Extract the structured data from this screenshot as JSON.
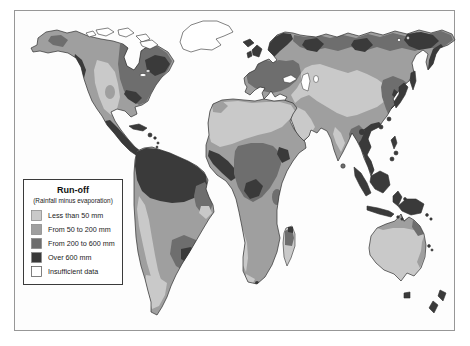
{
  "colors": {
    "less_than_50": "#c9c9c9",
    "from_50_to_200": "#9f9f9f",
    "from_200_to_600": "#6e6e6e",
    "over_600": "#3a3a3a",
    "insufficient_data": "#ffffff",
    "ocean": "#ffffff",
    "outline": "#2f2f2f",
    "frame_border": "#979797"
  },
  "legend": {
    "title": "Run-off",
    "subtitle": "(Rainfall minus evaporation)",
    "items": [
      {
        "label": "Less than 50 mm",
        "color_key": "less_than_50"
      },
      {
        "label": "From 50 to 200 mm",
        "color_key": "from_50_to_200"
      },
      {
        "label": "From 200 to 600 mm",
        "color_key": "from_200_to_600"
      },
      {
        "label": "Over 600 mm",
        "color_key": "over_600"
      },
      {
        "label": "Insufficient data",
        "color_key": "insufficient_data"
      }
    ]
  }
}
